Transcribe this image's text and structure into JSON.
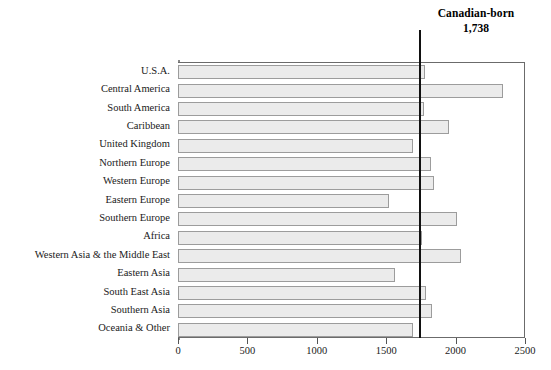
{
  "chart_data": {
    "type": "bar",
    "orientation": "horizontal",
    "title": "",
    "xlabel": "",
    "ylabel": "",
    "xlim": [
      0,
      2500
    ],
    "xticks": [
      0,
      500,
      1000,
      1500,
      2000,
      2500
    ],
    "xtick_labels": [
      "0",
      "500",
      "1000",
      "1500",
      "2000",
      "2500"
    ],
    "grid": false,
    "legend": null,
    "categories": [
      "U.S.A.",
      "Central America",
      "South America",
      "Caribbean",
      "United Kingdom",
      "Northern Europe",
      "Western  Europe",
      "Eastern  Europe",
      "Southern Europe",
      "Africa",
      "Western Asia & the Middle East",
      "Eastern Asia",
      "South East Asia",
      "Southern Asia",
      "Oceania & Other"
    ],
    "values": [
      1780,
      2340,
      1775,
      1950,
      1690,
      1820,
      1845,
      1520,
      2010,
      1755,
      2040,
      1560,
      1785,
      1830,
      1690
    ],
    "annotations": [
      {
        "name": "canadian-born-reference-line",
        "label": "Canadian-born",
        "value_label": "1,738",
        "value": 1738,
        "type": "vertical-line"
      }
    ],
    "colors": {
      "bar_fill": "#ebebeb",
      "bar_border": "#9c9c9c",
      "reference_line": "#111111",
      "axis": "#6b6b6b",
      "text": "#1a1a1a"
    }
  }
}
